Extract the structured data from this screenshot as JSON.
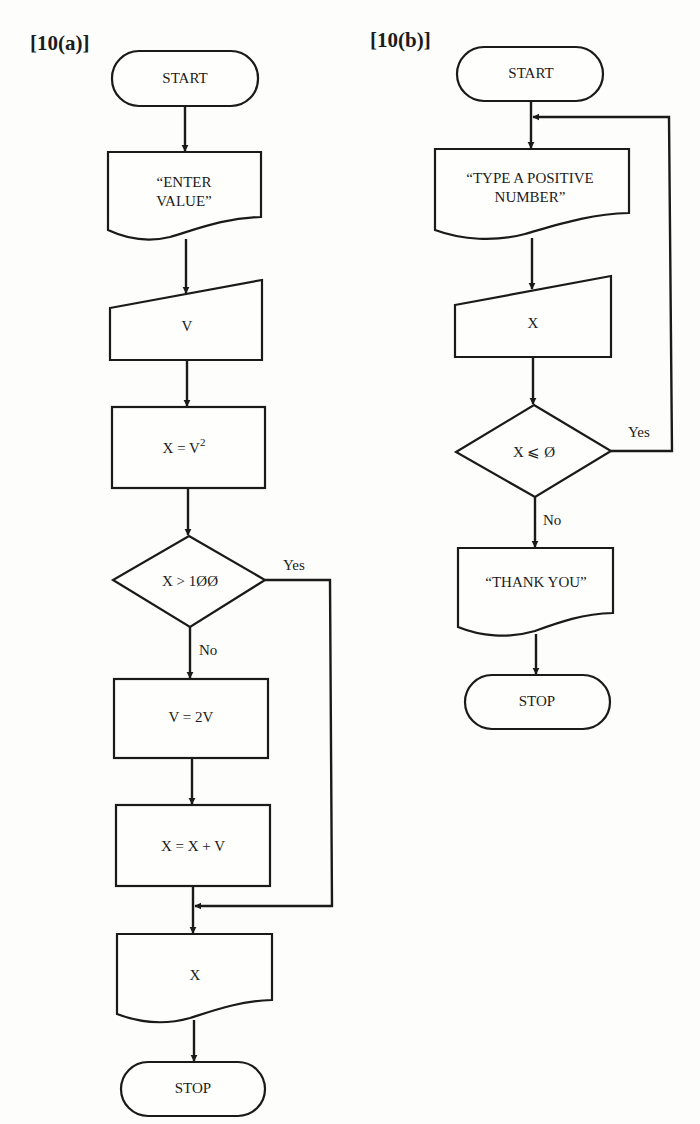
{
  "figures": [
    {
      "id": "10a",
      "label": "[10(a)]",
      "nodes": [
        {
          "key": "start",
          "type": "terminal",
          "text": "START"
        },
        {
          "key": "prompt",
          "type": "document",
          "lines": [
            "“ENTER",
            "VALUE”"
          ]
        },
        {
          "key": "input",
          "type": "manual-input",
          "text": "V"
        },
        {
          "key": "square",
          "type": "process",
          "text": "X = V",
          "superscript": "2"
        },
        {
          "key": "decision",
          "type": "decision",
          "text": "X > 1ØØ"
        },
        {
          "key": "double",
          "type": "process",
          "text": "V = 2V"
        },
        {
          "key": "add",
          "type": "process",
          "text": "X = X + V"
        },
        {
          "key": "output",
          "type": "document",
          "text": "X"
        },
        {
          "key": "stop",
          "type": "terminal",
          "text": "STOP"
        }
      ],
      "branches": {
        "yes": "Yes",
        "no": "No"
      }
    },
    {
      "id": "10b",
      "label": "[10(b)]",
      "nodes": [
        {
          "key": "start",
          "type": "terminal",
          "text": "START"
        },
        {
          "key": "prompt",
          "type": "document",
          "lines": [
            "“TYPE A  POSITIVE",
            "NUMBER”"
          ]
        },
        {
          "key": "input",
          "type": "manual-input",
          "text": "X"
        },
        {
          "key": "decision",
          "type": "decision",
          "text": "X ⩽ Ø"
        },
        {
          "key": "thanks",
          "type": "document",
          "text": "“THANK YOU”"
        },
        {
          "key": "stop",
          "type": "terminal",
          "text": "STOP"
        }
      ],
      "branches": {
        "yes": "Yes",
        "no": "No"
      }
    }
  ],
  "colors": {
    "ink": "#1a1a1a",
    "paper": "#fdfdfb"
  }
}
